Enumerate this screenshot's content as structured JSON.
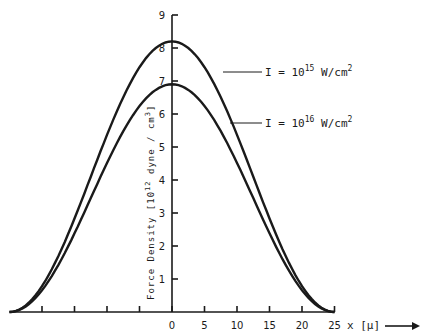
{
  "chart_data": {
    "type": "line",
    "title": "",
    "xlabel": "x [μ]",
    "ylabel": "Force Density [10^12 dyne / cm^3]",
    "ylabel_text": "Force Density [10",
    "ylabel_exp": "12",
    "ylabel_tail": " dyne / cm",
    "ylabel_tail_exp": "3",
    "ylabel_close": "]",
    "xlim": [
      -25,
      25
    ],
    "ylim": [
      0,
      9
    ],
    "x_ticks": [
      -20,
      -15,
      -10,
      -5,
      0,
      5,
      10,
      15,
      20,
      25
    ],
    "x_tick_labels": [
      "0",
      "5",
      "10",
      "15",
      "20",
      "25"
    ],
    "y_ticks": [
      1,
      2,
      3,
      4,
      5,
      6,
      7,
      8,
      9
    ],
    "y_tick_labels": [
      "1",
      "2",
      "3",
      "4",
      "5",
      "6",
      "7",
      "8",
      "9"
    ],
    "grid": false,
    "legend": "inline annotations with leader lines",
    "series": [
      {
        "name": "I = 10^15 W/cm^2",
        "label_main": "I = 10",
        "label_exp": "15",
        "label_tail": " W/cm",
        "label_tail_exp": "2",
        "peak": 8.2,
        "x": [
          -25,
          -20,
          -15,
          -10,
          -5,
          0,
          5,
          10,
          15,
          20,
          25
        ],
        "values": [
          0,
          0.7,
          2.5,
          5.0,
          7.2,
          8.2,
          7.2,
          5.0,
          2.5,
          0.7,
          0
        ]
      },
      {
        "name": "I = 10^16 W/cm^2",
        "label_main": "I = 10",
        "label_exp": "16",
        "label_tail": " W/cm",
        "label_tail_exp": "2",
        "peak": 6.9,
        "x": [
          -25,
          -20,
          -15,
          -10,
          -5,
          0,
          5,
          10,
          15,
          20,
          25
        ],
        "values": [
          0,
          0.6,
          2.1,
          4.2,
          6.0,
          6.9,
          6.0,
          4.2,
          2.1,
          0.6,
          0
        ]
      }
    ]
  }
}
